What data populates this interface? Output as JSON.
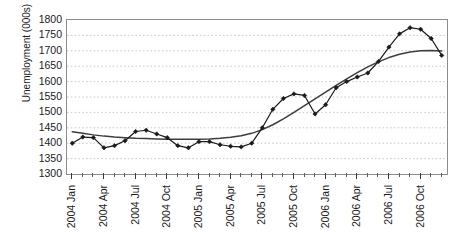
{
  "chart_data": {
    "type": "line",
    "title": "",
    "xlabel": "",
    "ylabel": "Unemployment (000s)",
    "ylim": [
      1300,
      1800
    ],
    "ytick_step": 50,
    "yticks": [
      1800,
      1750,
      1700,
      1650,
      1600,
      1550,
      1500,
      1450,
      1400,
      1350,
      1300
    ],
    "grid": "horizontal-dashed",
    "legend": "none",
    "x": [
      "2004 Jan",
      "2004 Feb",
      "2004 Mar",
      "2004 Apr",
      "2004 May",
      "2004 Jun",
      "2004 Jul",
      "2004 Aug",
      "2004 Sep",
      "2004 Oct",
      "2004 Nov",
      "2004 Dec",
      "2005 Jan",
      "2005 Feb",
      "2005 Mar",
      "2005 Apr",
      "2005 May",
      "2005 Jun",
      "2005 Jul",
      "2005 Aug",
      "2005 Sep",
      "2005 Oct",
      "2005 Nov",
      "2005 Dec",
      "2006 Jan",
      "2006 Feb",
      "2006 Mar",
      "2006 Apr",
      "2006 May",
      "2006 Jun",
      "2006 Jul",
      "2006 Aug",
      "2006 Sep",
      "2006 Oct",
      "2006 Nov",
      "2006 Dec"
    ],
    "xtick_labels": [
      "2004 Jan",
      "2004 Apr",
      "2004 Jul",
      "2004 Oct",
      "2005 Jan",
      "2005 Apr",
      "2005 Jul",
      "2005 Oct",
      "2006 Jan",
      "2006 Apr",
      "2006 Jul",
      "2006 Oct"
    ],
    "xtick_label_indices": [
      0,
      3,
      6,
      9,
      12,
      15,
      18,
      21,
      24,
      27,
      30,
      33
    ],
    "series": [
      {
        "name": "Unemployment (monthly)",
        "style": "line-with-diamond-markers",
        "color": "#1a1a1a",
        "values": [
          1400,
          1420,
          1418,
          1385,
          1392,
          1408,
          1438,
          1442,
          1430,
          1418,
          1392,
          1385,
          1405,
          1405,
          1395,
          1390,
          1388,
          1400,
          1450,
          1510,
          1545,
          1560,
          1555,
          1495,
          1525,
          1580,
          1600,
          1615,
          1628,
          1665,
          1712,
          1755,
          1775,
          1770,
          1740,
          1685
        ]
      },
      {
        "name": "Trend",
        "style": "smooth-line",
        "color": "#3d3d3d",
        "values": [
          1437,
          1432,
          1427,
          1423,
          1420,
          1418,
          1416,
          1415,
          1414,
          1413,
          1413,
          1413,
          1413,
          1414,
          1416,
          1419,
          1424,
          1432,
          1444,
          1460,
          1479,
          1500,
          1522,
          1544,
          1566,
          1588,
          1609,
          1629,
          1648,
          1664,
          1678,
          1689,
          1696,
          1700,
          1701,
          1699
        ]
      }
    ],
    "last_points_note": [
      1660,
      1645
    ]
  }
}
